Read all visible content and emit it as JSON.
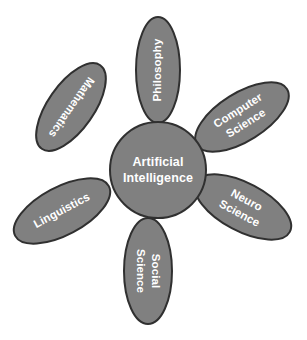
{
  "diagram": {
    "title_center": "Artificial Intelligence",
    "center": {
      "label_line1": "Artificial",
      "label_line2": "Intelligence",
      "shape": "circle",
      "cx": 158,
      "cy": 170,
      "r": 48,
      "fill": "#808080",
      "stroke": "#303030"
    },
    "style": {
      "background": "#ffffff",
      "petal_fill": "#808080",
      "petal_stroke": "#303030",
      "label_color": "#ffffff"
    },
    "petals": [
      {
        "id": "philosophy",
        "label_line1": "Philosophy",
        "label_line2": "",
        "cx": 158,
        "cy": 70,
        "rx": 22,
        "ry": 53,
        "ellipse_rotation": 0,
        "text_rotation": -90
      },
      {
        "id": "computer-science",
        "label_line1": "Computer",
        "label_line2": "Science",
        "cx": 242,
        "cy": 117,
        "rx": 53,
        "ry": 24,
        "ellipse_rotation": -32,
        "text_rotation": -32
      },
      {
        "id": "neuro-science",
        "label_line1": "Neuro",
        "label_line2": "Science",
        "cx": 243,
        "cy": 207,
        "rx": 53,
        "ry": 24,
        "ellipse_rotation": 28,
        "text_rotation": 28
      },
      {
        "id": "social-science",
        "label_line1": "Social",
        "label_line2": "Science",
        "cx": 148,
        "cy": 271,
        "rx": 24,
        "ry": 53,
        "ellipse_rotation": 0,
        "text_rotation": 90
      },
      {
        "id": "linguistics",
        "label_line1": "Linguistics",
        "label_line2": "",
        "cx": 62,
        "cy": 211,
        "rx": 53,
        "ry": 24,
        "ellipse_rotation": -28,
        "text_rotation": -28
      },
      {
        "id": "mathematics",
        "label_line1": "Mathematics",
        "label_line2": "",
        "cx": 71,
        "cy": 107,
        "rx": 51,
        "ry": 23,
        "ellipse_rotation": -55,
        "text_rotation": 125
      }
    ]
  }
}
